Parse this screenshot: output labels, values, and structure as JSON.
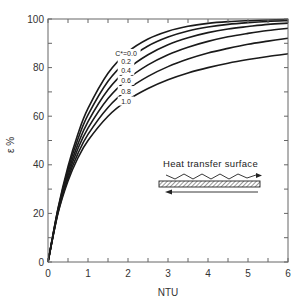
{
  "chart_data": {
    "type": "line",
    "title": "",
    "xlabel": "NTU",
    "ylabel": "ε %",
    "xlim": [
      0,
      6
    ],
    "ylim": [
      0,
      100
    ],
    "grid": false,
    "x_ticks": [
      0,
      1,
      2,
      3,
      4,
      5,
      6
    ],
    "x_minor_ticks": [
      0.5,
      1.5,
      2.5,
      3.5,
      4.5,
      5.5
    ],
    "y_ticks": [
      0,
      20,
      40,
      60,
      80,
      100
    ],
    "y_minor_ticks": [
      10,
      30,
      50,
      70,
      90
    ],
    "x": [
      0,
      0.25,
      0.5,
      0.75,
      1,
      1.5,
      2,
      2.5,
      3,
      3.5,
      4,
      4.5,
      5,
      5.5,
      6
    ],
    "series": [
      {
        "name": "C*=0.0",
        "label": "C*=0.0",
        "values": [
          0,
          22.1,
          39.3,
          52.8,
          63.2,
          77.7,
          86.5,
          91.8,
          95.0,
          97.0,
          98.2,
          98.9,
          99.3,
          99.6,
          99.75
        ]
      },
      {
        "name": "C*=0.2",
        "label": "0.2",
        "values": [
          0,
          21.7,
          38.1,
          50.7,
          60.5,
          74.4,
          83.2,
          88.9,
          92.6,
          95.1,
          96.7,
          97.8,
          98.5,
          99.0,
          99.3
        ]
      },
      {
        "name": "C*=0.4",
        "label": "0.4",
        "values": [
          0,
          21.2,
          36.8,
          48.6,
          57.8,
          70.9,
          79.5,
          85.3,
          89.4,
          92.3,
          94.4,
          95.9,
          96.9,
          97.8,
          98.3
        ]
      },
      {
        "name": "C*=0.6",
        "label": "0.6",
        "values": [
          0,
          20.8,
          35.6,
          46.7,
          55.1,
          67.3,
          75.4,
          81.1,
          85.3,
          88.4,
          90.8,
          92.7,
          94.1,
          95.3,
          96.2
        ]
      },
      {
        "name": "C*=0.8",
        "label": "0.8",
        "values": [
          0,
          20.4,
          34.5,
          44.7,
          52.5,
          63.6,
          71.1,
          76.4,
          80.4,
          83.5,
          86.0,
          87.9,
          89.6,
          90.9,
          92.1
        ]
      },
      {
        "name": "C*=1.0",
        "label": "1.0",
        "values": [
          0,
          20.0,
          33.3,
          42.9,
          50.0,
          60.0,
          66.7,
          71.4,
          75.0,
          77.8,
          80.0,
          81.8,
          83.3,
          84.6,
          85.7
        ]
      }
    ],
    "curve_label_x": 1.95,
    "annotations": [
      {
        "text": "Heat transfer surface",
        "type": "inset-diagram",
        "description": "Wavy arrow flowing right above a hatched wall; straight arrow flowing left below (counterflow)"
      }
    ],
    "legend": "inline curve labels"
  },
  "colors": {
    "curve": "#1a1a1a",
    "axis": "#555555",
    "background": "#ffffff"
  }
}
